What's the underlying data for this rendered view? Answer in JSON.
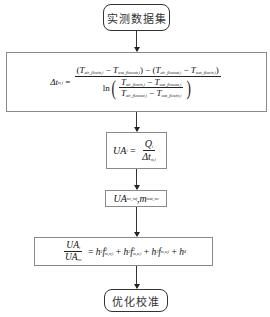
{
  "diagram": {
    "type": "flowchart",
    "nodes": [
      {
        "id": "start",
        "shape": "rounded",
        "label": "实测数据集"
      },
      {
        "id": "lmtd",
        "shape": "rect",
        "label": "Δt_m,i = ((T_air_flowin,i − T_wat_flowout,i) − (T_air_flowout,i − T_wat_flowin,i)) / ln((T_air_flowin,i − T_wat_flowout,i)/(T_air_flowout,i − T_wat_flowin,i))"
      },
      {
        "id": "ua",
        "shape": "rect",
        "label": "UA_i = Q_i / Δt_m,i"
      },
      {
        "id": "ref",
        "shape": "rect",
        "label": "UA_no_ref , m_wat_no"
      },
      {
        "id": "fit",
        "shape": "rect",
        "label": "UA_i / UA_no = h1 f^3_m,w,i + h2 f^2_m,w,i + h3 f_m,w,i + h4"
      },
      {
        "id": "end",
        "shape": "rounded",
        "label": "优化校准"
      }
    ],
    "edges": [
      [
        "start",
        "lmtd"
      ],
      [
        "lmtd",
        "ua"
      ],
      [
        "ua",
        "ref"
      ],
      [
        "ref",
        "fit"
      ],
      [
        "fit",
        "end"
      ]
    ]
  },
  "start_label": "实测数据集",
  "end_label": "优化校准",
  "eq1": {
    "lhs": "Δt",
    "lhs_sub": "m,i",
    "T": "T",
    "air_in": "air_flowin,i",
    "air_out": "air_flowout,i",
    "wat_in": "wat_flowin,i",
    "wat_out": "wat_flowout,i",
    "ln": "ln"
  },
  "eq2": {
    "lhs": "UA",
    "lhs_sub": "i",
    "num": "Q",
    "num_sub": "i",
    "den": "Δt",
    "den_sub": "m,i"
  },
  "eq3": {
    "a": "UA",
    "a_sub": "no_ref",
    "sep": " , ",
    "b": "m",
    "b_sub": "wat_no"
  },
  "eq4": {
    "num": "UA",
    "num_sub": "i",
    "den": "UA",
    "den_sub": "no",
    "h1": "h",
    "h1_sub": "1",
    "h2": "h",
    "h2_sub": "2",
    "h3": "h",
    "h3_sub": "3",
    "h4": "h",
    "h4_sub": "4",
    "f": "f",
    "f_sub": "m,w,i",
    "p3": "3",
    "p2": "2"
  }
}
